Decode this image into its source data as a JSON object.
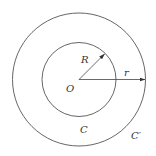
{
  "diagram": {
    "type": "concentric-circles",
    "center": {
      "label": "O",
      "x": 79,
      "y": 79
    },
    "inner_circle": {
      "label": "C",
      "radius_label": "R",
      "radius_px": 37
    },
    "outer_circle": {
      "label": "C′",
      "radius_label": "r",
      "radius_px": 66
    },
    "stroke_color": "#555555",
    "label_color": "#333333"
  },
  "labels": {
    "center": "O",
    "inner_radius": "R",
    "outer_radius": "r",
    "inner_circle": "C",
    "outer_circle": "C′"
  }
}
